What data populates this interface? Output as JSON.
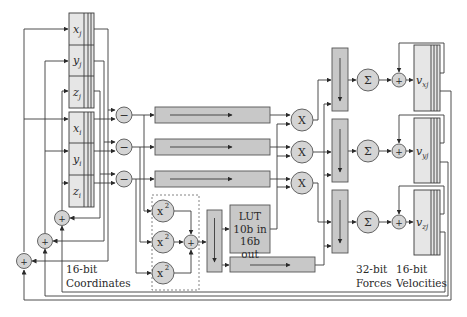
{
  "diagram": {
    "registers": {
      "j": [
        "x",
        "y",
        "z"
      ],
      "j_sub": "j",
      "i": [
        "x",
        "y",
        "z"
      ],
      "i_sub": "i",
      "velocity": [
        "v",
        "v",
        "v"
      ],
      "velocity_sub": [
        "xj",
        "yj",
        "zj"
      ]
    },
    "operators": {
      "subtract": "−",
      "multiply": "X",
      "square": "x",
      "square_exp": "2",
      "add": "+",
      "sum": "Σ"
    },
    "lut": {
      "line1": "LUT",
      "line2": "10b in",
      "line3": "16b out"
    },
    "captions": {
      "coordinates_line1": "16-bit",
      "coordinates_line2": "Coordinates",
      "forces_line1": "32-bit",
      "forces_line2": "Forces",
      "velocities_line1": "16-bit",
      "velocities_line2": "Velocities"
    },
    "colors": {
      "register_fill": "#e6e6e6",
      "pipeline_fill": "#c8c8c8",
      "operator_fill": "#d4d4d4",
      "line": "#3a3a3a"
    }
  }
}
